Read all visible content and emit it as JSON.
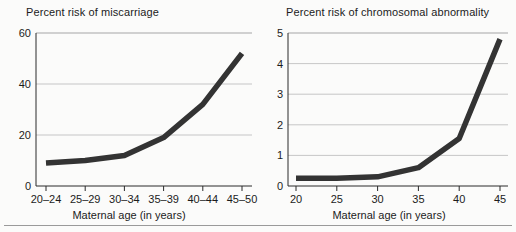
{
  "figure": {
    "width": 516,
    "height": 232,
    "background": "#fbfbfa",
    "line_color": "#333333",
    "grid_color": "#b9b9b9",
    "axis_color": "#2b2b2b"
  },
  "chart_data": [
    {
      "type": "line",
      "title": "Percent risk of miscarriage",
      "xlabel": "Maternal age (in years)",
      "ylabel": "",
      "categories": [
        "20–24",
        "25–29",
        "30–34",
        "35–39",
        "40–44",
        "45–50"
      ],
      "values": [
        9,
        10,
        12,
        19,
        32,
        52
      ],
      "ylim": [
        0,
        60
      ],
      "yticks": [
        "0",
        "20",
        "40",
        "60"
      ],
      "ytick_values": [
        0,
        20,
        40,
        60
      ],
      "grid": true,
      "legend": "none"
    },
    {
      "type": "line",
      "title": "Percent risk of chromosomal abnormality",
      "xlabel": "Maternal age (in years)",
      "ylabel": "",
      "categories": [
        "20",
        "25",
        "30",
        "35",
        "40",
        "45"
      ],
      "values": [
        0.25,
        0.25,
        0.3,
        0.6,
        1.55,
        4.8
      ],
      "ylim": [
        0,
        5
      ],
      "yticks": [
        "0",
        "1",
        "2",
        "3",
        "4",
        "5"
      ],
      "ytick_values": [
        0,
        1,
        2,
        3,
        4,
        5
      ],
      "grid": true,
      "legend": "none"
    }
  ]
}
